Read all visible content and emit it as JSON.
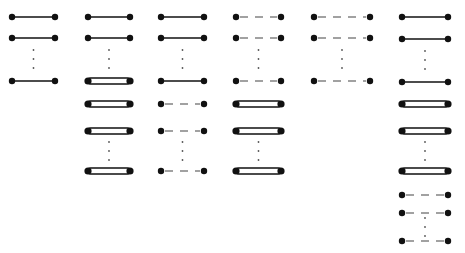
{
  "diagram": {
    "colors": {
      "ink": "#111111",
      "ellipsis": "#555555",
      "background": "#ffffff"
    },
    "columns": [
      {
        "x1": 12,
        "x2": 55,
        "rows": [
          {
            "y": 17,
            "type": "solid"
          },
          {
            "y": 38,
            "type": "solid"
          },
          {
            "y": 59,
            "type": "ellipsis"
          },
          {
            "y": 81,
            "type": "solid"
          }
        ]
      },
      {
        "x1": 88,
        "x2": 130,
        "rows": [
          {
            "y": 17,
            "type": "solid"
          },
          {
            "y": 38,
            "type": "solid"
          },
          {
            "y": 59,
            "type": "ellipsis"
          },
          {
            "y": 81,
            "type": "band"
          },
          {
            "y": 104,
            "type": "band"
          },
          {
            "y": 131,
            "type": "band"
          },
          {
            "y": 151,
            "type": "ellipsis"
          },
          {
            "y": 171,
            "type": "band"
          }
        ]
      },
      {
        "x1": 161,
        "x2": 204,
        "rows": [
          {
            "y": 17,
            "type": "solid"
          },
          {
            "y": 38,
            "type": "solid"
          },
          {
            "y": 59,
            "type": "ellipsis"
          },
          {
            "y": 81,
            "type": "solid"
          },
          {
            "y": 104,
            "type": "dashed"
          },
          {
            "y": 131,
            "type": "dashed"
          },
          {
            "y": 151,
            "type": "ellipsis"
          },
          {
            "y": 171,
            "type": "dashed"
          }
        ]
      },
      {
        "x1": 236,
        "x2": 281,
        "rows": [
          {
            "y": 17,
            "type": "dashed"
          },
          {
            "y": 38,
            "type": "dashed"
          },
          {
            "y": 59,
            "type": "ellipsis"
          },
          {
            "y": 81,
            "type": "dashed"
          },
          {
            "y": 104,
            "type": "band"
          },
          {
            "y": 131,
            "type": "band"
          },
          {
            "y": 151,
            "type": "ellipsis"
          },
          {
            "y": 171,
            "type": "band"
          }
        ]
      },
      {
        "x1": 314,
        "x2": 370,
        "rows": [
          {
            "y": 17,
            "type": "dashed"
          },
          {
            "y": 38,
            "type": "dashed"
          },
          {
            "y": 59,
            "type": "ellipsis"
          },
          {
            "y": 81,
            "type": "dashed"
          }
        ]
      },
      {
        "x1": 402,
        "x2": 448,
        "rows": [
          {
            "y": 17,
            "type": "solid"
          },
          {
            "y": 39,
            "type": "solid"
          },
          {
            "y": 60,
            "type": "ellipsis"
          },
          {
            "y": 82,
            "type": "solid"
          },
          {
            "y": 104,
            "type": "band"
          },
          {
            "y": 131,
            "type": "band"
          },
          {
            "y": 151,
            "type": "ellipsis"
          },
          {
            "y": 171,
            "type": "band"
          },
          {
            "y": 195,
            "type": "dashed"
          },
          {
            "y": 213,
            "type": "dashed"
          },
          {
            "y": 227,
            "type": "ellipsis"
          },
          {
            "y": 241,
            "type": "dashed"
          }
        ]
      }
    ]
  }
}
